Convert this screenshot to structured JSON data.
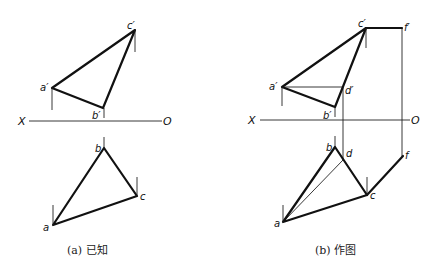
{
  "figure_a": {
    "caption": "(a) 已知",
    "axis": {
      "left_label": "X",
      "right_label": "O"
    },
    "labels": {
      "a_prime": "a′",
      "b_prime": "b′",
      "c_prime": "c′",
      "a": "a",
      "b": "b",
      "c": "c"
    }
  },
  "figure_b": {
    "caption": "(b) 作图",
    "axis": {
      "left_label": "X",
      "right_label": "O"
    },
    "labels": {
      "a_prime": "a′",
      "b_prime": "b′",
      "c_prime": "c′",
      "d_prime": "d′",
      "f_prime": "f′",
      "a": "a",
      "b": "b",
      "c": "c",
      "d": "d",
      "f": "f"
    }
  }
}
